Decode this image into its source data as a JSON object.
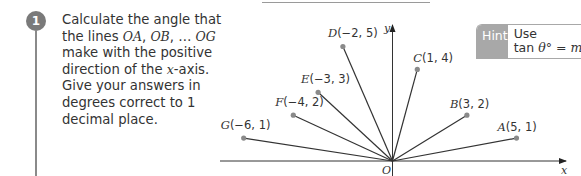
{
  "question": {
    "number": "1",
    "text_parts": [
      {
        "t": "Calculate the angle that the lines "
      },
      {
        "t": "OA",
        "i": true
      },
      {
        "t": ", "
      },
      {
        "t": "OB",
        "i": true
      },
      {
        "t": ", … "
      },
      {
        "t": "OG",
        "i": true
      },
      {
        "t": " make with the positive direction of the "
      },
      {
        "t": "x",
        "i": true
      },
      {
        "t": "-axis. Give your answers in degrees correct to 1 decimal place."
      }
    ]
  },
  "hint": {
    "label": "Hint",
    "line1": "Use",
    "line2_prefix": "tan ",
    "line2_theta": "θ",
    "line2_suffix": "° = ",
    "line2_m": "m"
  },
  "diagram": {
    "origin_label": "O",
    "x_axis_label": "x",
    "y_axis_label": "y",
    "points": [
      {
        "name": "A",
        "coords": "(5, 1)",
        "x": 5,
        "y": 1
      },
      {
        "name": "B",
        "coords": "(3, 2)",
        "x": 3,
        "y": 2
      },
      {
        "name": "C",
        "coords": "(1, 4)",
        "x": 1,
        "y": 4
      },
      {
        "name": "D",
        "coords": "(−2, 5)",
        "x": -2,
        "y": 5
      },
      {
        "name": "E",
        "coords": "(−3, 3)",
        "x": -3,
        "y": 3
      },
      {
        "name": "F",
        "coords": "(−4, 2)",
        "x": -4,
        "y": 2
      },
      {
        "name": "G",
        "coords": "(−6, 1)",
        "x": -6,
        "y": 1
      }
    ]
  },
  "colors": {
    "badge": "#7a7a7a",
    "hint_label_bg": "#a8a8a8",
    "line": "#333333",
    "point": "#8a8a8a"
  }
}
